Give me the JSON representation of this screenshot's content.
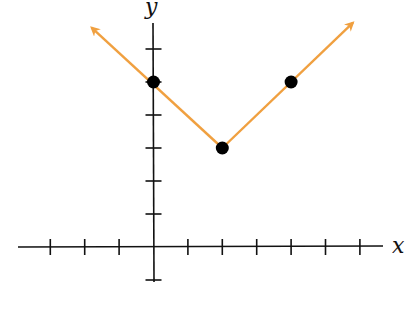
{
  "chart_data": {
    "type": "line",
    "title": "",
    "xlabel": "x",
    "ylabel": "y",
    "xlim": [
      -4,
      6
    ],
    "ylim": [
      -1,
      6
    ],
    "x_ticks": [
      -3,
      -2,
      -1,
      1,
      2,
      3,
      4,
      5,
      6
    ],
    "y_ticks": [
      -1,
      1,
      2,
      3,
      4,
      5,
      6
    ],
    "tick_labels_shown": false,
    "grid": false,
    "legend": null,
    "series": [
      {
        "name": "absolute value function",
        "color": "#F0A040",
        "line": {
          "x": [
            -2,
            0,
            2,
            4,
            6
          ],
          "y": [
            7,
            5,
            3,
            5,
            7
          ]
        },
        "arrows_at_ends": true,
        "equation_implied": "y = |x - 2| + 3"
      }
    ],
    "points": [
      {
        "x": 0,
        "y": 5
      },
      {
        "x": 2,
        "y": 3
      },
      {
        "x": 4,
        "y": 5
      }
    ],
    "point_color": "#000000"
  },
  "labels": {
    "x_axis": "x",
    "y_axis": "y"
  }
}
